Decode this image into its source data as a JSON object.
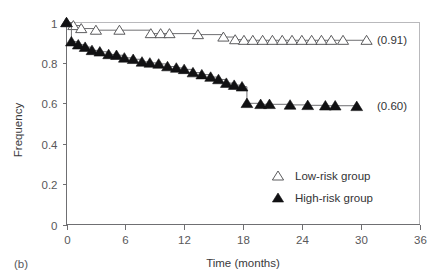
{
  "chart_data": {
    "type": "line",
    "title": "",
    "panel_label": "(b)",
    "xlabel": "Time (months)",
    "ylabel": "Frequency",
    "xlim": [
      0,
      36
    ],
    "ylim": [
      0,
      1
    ],
    "xticks": [
      0,
      6,
      12,
      18,
      24,
      30,
      36
    ],
    "xtick_labels": [
      "0",
      "6",
      "12",
      "18",
      "24",
      "30",
      "36"
    ],
    "yticks": [
      0,
      0.2,
      0.4,
      0.6,
      0.8,
      1
    ],
    "ytick_labels": [
      "0",
      "0.2",
      "0.4",
      "0.6",
      "0.8",
      "1"
    ],
    "grid": false,
    "legend_position": "inside-lower-right",
    "series": [
      {
        "name": "Low-risk group",
        "marker": "open-triangle-up",
        "endpoint_label": "(0.91)",
        "endpoint_value": 0.91,
        "points": [
          {
            "x": 0.0,
            "y": 1.0
          },
          {
            "x": 0.7,
            "y": 0.985
          },
          {
            "x": 1.5,
            "y": 0.97
          },
          {
            "x": 3.0,
            "y": 0.962
          },
          {
            "x": 5.4,
            "y": 0.962
          },
          {
            "x": 8.6,
            "y": 0.945
          },
          {
            "x": 9.6,
            "y": 0.945
          },
          {
            "x": 10.5,
            "y": 0.945
          },
          {
            "x": 13.4,
            "y": 0.94
          },
          {
            "x": 16.0,
            "y": 0.928
          },
          {
            "x": 17.2,
            "y": 0.915
          },
          {
            "x": 18.1,
            "y": 0.912
          },
          {
            "x": 19.0,
            "y": 0.912
          },
          {
            "x": 20.0,
            "y": 0.912
          },
          {
            "x": 21.0,
            "y": 0.912
          },
          {
            "x": 22.0,
            "y": 0.912
          },
          {
            "x": 23.0,
            "y": 0.912
          },
          {
            "x": 24.0,
            "y": 0.912
          },
          {
            "x": 25.0,
            "y": 0.912
          },
          {
            "x": 26.0,
            "y": 0.912
          },
          {
            "x": 27.0,
            "y": 0.912
          },
          {
            "x": 28.2,
            "y": 0.912
          },
          {
            "x": 30.6,
            "y": 0.912
          }
        ]
      },
      {
        "name": "High-risk group",
        "marker": "filled-triangle-up",
        "endpoint_label": "(0.60)",
        "endpoint_value": 0.6,
        "points": [
          {
            "x": 0.0,
            "y": 1.0
          },
          {
            "x": 0.5,
            "y": 0.905
          },
          {
            "x": 1.2,
            "y": 0.89
          },
          {
            "x": 1.9,
            "y": 0.878
          },
          {
            "x": 2.6,
            "y": 0.862
          },
          {
            "x": 3.4,
            "y": 0.855
          },
          {
            "x": 4.3,
            "y": 0.842
          },
          {
            "x": 5.1,
            "y": 0.838
          },
          {
            "x": 5.9,
            "y": 0.825
          },
          {
            "x": 6.8,
            "y": 0.818
          },
          {
            "x": 7.7,
            "y": 0.805
          },
          {
            "x": 8.5,
            "y": 0.8
          },
          {
            "x": 9.4,
            "y": 0.795
          },
          {
            "x": 10.3,
            "y": 0.782
          },
          {
            "x": 11.2,
            "y": 0.775
          },
          {
            "x": 12.0,
            "y": 0.768
          },
          {
            "x": 12.9,
            "y": 0.752
          },
          {
            "x": 13.8,
            "y": 0.742
          },
          {
            "x": 14.7,
            "y": 0.73
          },
          {
            "x": 15.5,
            "y": 0.718
          },
          {
            "x": 16.3,
            "y": 0.7
          },
          {
            "x": 17.1,
            "y": 0.69
          },
          {
            "x": 17.9,
            "y": 0.682
          },
          {
            "x": 18.4,
            "y": 0.6
          },
          {
            "x": 19.8,
            "y": 0.595
          },
          {
            "x": 20.7,
            "y": 0.595
          },
          {
            "x": 22.8,
            "y": 0.592
          },
          {
            "x": 24.6,
            "y": 0.59
          },
          {
            "x": 26.4,
            "y": 0.588
          },
          {
            "x": 27.4,
            "y": 0.588
          },
          {
            "x": 29.6,
            "y": 0.585
          }
        ]
      }
    ]
  },
  "legend": {
    "items": [
      {
        "label": "Low-risk group",
        "marker": "open-triangle-up"
      },
      {
        "label": "High-risk group",
        "marker": "filled-triangle-up"
      }
    ]
  },
  "colors": {
    "axis": "#6f6f72",
    "frame": "#b9b9bc",
    "line": "#6f6f72",
    "marker_filled": "#111113",
    "marker_open_fill": "#ffffff",
    "marker_open_stroke": "#4a4a4c",
    "text": "#333335",
    "background": "#ffffff"
  }
}
